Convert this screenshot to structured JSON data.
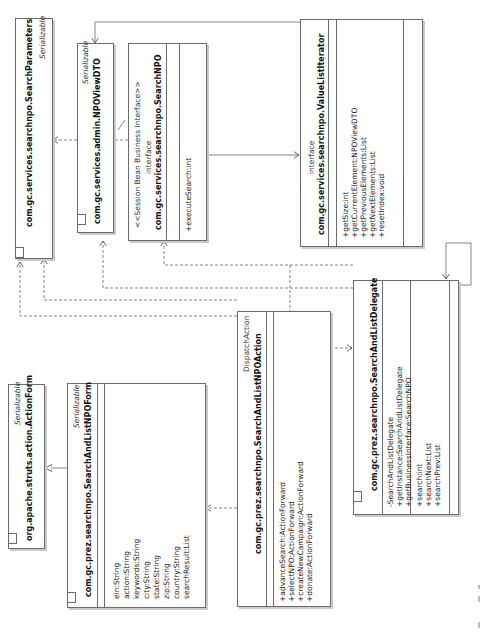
{
  "diagram": {
    "orientation": "rotated-90-ccw",
    "classes": {
      "search_parameters": {
        "stereotype": "Serializable",
        "name": "com.gc.services.searchnpo.SearchParameters",
        "attributes": [],
        "operations": []
      },
      "npo_view_dto": {
        "stereotype": "Serializable",
        "name": "com.gc.services.admin.NPOViewDTO",
        "attributes": [],
        "operations": []
      },
      "search_npo": {
        "stereotype": "<<Session Bean Business Interface>>",
        "kind": "interface",
        "name": "com.gc.services.searchnpo.SearchNPO",
        "attributes": [],
        "operations": [
          "+executeSearch:int"
        ]
      },
      "value_list_iterator": {
        "kind": "interface",
        "name": "com.gc.services.searchnpo.ValueListIterator",
        "attributes": [],
        "operations": [
          "+getSize:int",
          "+getCurrentElement:NPOViewDTO",
          "+getPreviousElements:List",
          "+getNextElements:List",
          "+resetIndex:void"
        ]
      },
      "action_form": {
        "stereotype": "Serializable",
        "name": "org.apache.struts.action.ActionForm",
        "attributes": [],
        "operations": []
      },
      "search_and_list_npo_form": {
        "stereotype": "Serializable",
        "name": "com.gc.prez.searchnpo.SearchAndListNPOForm",
        "attributes": [
          "ein:String",
          "action:String",
          "keywords:String",
          "city:String",
          "state:String",
          "zip:String",
          "country:String",
          "searchResult:List"
        ],
        "operations": []
      },
      "search_and_list_npo_action": {
        "stereotype": "DispatchAction",
        "name": "com.gc.prez.searchnpo.SearchAndListNPOAction",
        "attributes": [],
        "operations": [
          "+advanceSearch:ActionForward",
          "+selectNPO:ActionForward",
          "+createNewCampaign:ActionForward",
          "+donate:ActionForward"
        ]
      },
      "search_and_list_delegate": {
        "name": "com.gc.prez.searchnpo.SearchAndListDelegate",
        "attributes": [
          "-SearchAndListDelegate"
        ],
        "operations": [
          "+getInstance:SearchAndListDelegate",
          "+getBusinessInterface:SearchNPO",
          "+search:int",
          "+searchNext:List",
          "+searchPrev:List"
        ]
      }
    },
    "relationships": [
      {
        "from": "search_and_list_npo_form",
        "to": "action_form",
        "type": "generalization"
      },
      {
        "from": "search_and_list_npo_action",
        "to": "search_and_list_npo_form",
        "type": "dependency"
      },
      {
        "from": "search_and_list_npo_action",
        "to": "search_and_list_delegate",
        "type": "dependency"
      },
      {
        "from": "search_and_list_npo_action",
        "to": "search_parameters",
        "type": "dependency"
      },
      {
        "from": "search_and_list_npo_action",
        "to": "npo_view_dto",
        "type": "dependency"
      },
      {
        "from": "search_and_list_delegate",
        "to": "search_parameters",
        "type": "dependency"
      },
      {
        "from": "search_and_list_delegate",
        "to": "search_npo",
        "type": "dependency"
      },
      {
        "from": "search_and_list_delegate",
        "to": "search_and_list_delegate",
        "type": "self-association"
      },
      {
        "from": "search_npo",
        "to": "value_list_iterator",
        "type": "association"
      },
      {
        "from": "search_npo",
        "to": "search_parameters",
        "type": "dependency"
      },
      {
        "from": "value_list_iterator",
        "to": "npo_view_dto",
        "type": "association"
      }
    ],
    "colors": {
      "line": "#6b6b6b",
      "shadow": "#c9c9c9",
      "background": "#ffffff"
    }
  }
}
